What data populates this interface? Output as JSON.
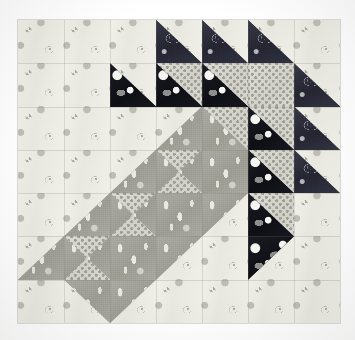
{
  "image": {
    "kind": "quilt-block-photograph",
    "title": "Patchwork quilt block",
    "background_color": "#ffffff",
    "block": {
      "left": 18,
      "top": 20,
      "width": 322,
      "height": 303,
      "rows": 7,
      "columns": 7
    }
  },
  "fabrics": [
    {
      "key": "light",
      "name": "cream floral background",
      "color": "#e9e8e0"
    },
    {
      "key": "dark",
      "name": "navy paisley",
      "color": "#2c2d3a"
    },
    {
      "key": "black",
      "name": "black large-dot print",
      "color": "#15161c"
    },
    {
      "key": "medium",
      "name": "gray teardrop paisley",
      "color": "#a3a29a"
    },
    {
      "key": "dotted",
      "name": "light gray dotted",
      "color": "#d5d4cc"
    }
  ],
  "grid": [
    [
      {
        "type": "plain",
        "a": "light"
      },
      {
        "type": "plain",
        "a": "light"
      },
      {
        "type": "plain",
        "a": "light"
      },
      {
        "type": "hst",
        "dir": "bl",
        "a": "dark",
        "b": "light"
      },
      {
        "type": "hst",
        "dir": "bl",
        "a": "dark",
        "b": "light"
      },
      {
        "type": "hst",
        "dir": "bl",
        "a": "dark",
        "b": "light"
      },
      {
        "type": "plain",
        "a": "light"
      }
    ],
    [
      {
        "type": "plain",
        "a": "light"
      },
      {
        "type": "plain",
        "a": "light"
      },
      {
        "type": "hst",
        "dir": "bl",
        "a": "black",
        "b": "light"
      },
      {
        "type": "hst",
        "dir": "bl",
        "a": "black",
        "b": "dotted"
      },
      {
        "type": "hst",
        "dir": "bl",
        "a": "black",
        "b": "dotted"
      },
      {
        "type": "qsquare",
        "top": "dotted",
        "right": "dotted",
        "bottom": "dotted",
        "left": "dotted"
      },
      {
        "type": "hst",
        "dir": "bl",
        "a": "dark",
        "b": "light"
      }
    ],
    [
      {
        "type": "plain",
        "a": "light"
      },
      {
        "type": "plain",
        "a": "light"
      },
      {
        "type": "plain",
        "a": "light"
      },
      {
        "type": "hst",
        "dir": "br",
        "a": "medium",
        "b": "light"
      },
      {
        "type": "hst",
        "dir": "bl",
        "a": "medium",
        "b": "dotted"
      },
      {
        "type": "hst",
        "dir": "bl",
        "a": "black",
        "b": "dotted"
      },
      {
        "type": "hst",
        "dir": "bl",
        "a": "dark",
        "b": "light"
      }
    ],
    [
      {
        "type": "plain",
        "a": "light"
      },
      {
        "type": "plain",
        "a": "light"
      },
      {
        "type": "hst",
        "dir": "br",
        "a": "medium",
        "b": "light"
      },
      {
        "type": "qsquare",
        "top": "dotted",
        "right": "medium",
        "bottom": "dotted",
        "left": "medium"
      },
      {
        "type": "plain",
        "a": "medium"
      },
      {
        "type": "hst",
        "dir": "bl",
        "a": "black",
        "b": "dotted"
      },
      {
        "type": "hst",
        "dir": "bl",
        "a": "dark",
        "b": "light"
      }
    ],
    [
      {
        "type": "plain",
        "a": "light"
      },
      {
        "type": "hst",
        "dir": "br",
        "a": "medium",
        "b": "light"
      },
      {
        "type": "qsquare",
        "top": "dotted",
        "right": "medium",
        "bottom": "dotted",
        "left": "medium"
      },
      {
        "type": "plain",
        "a": "medium"
      },
      {
        "type": "hst",
        "dir": "tl",
        "a": "medium",
        "b": "light"
      },
      {
        "type": "hst",
        "dir": "bl",
        "a": "black",
        "b": "dotted"
      },
      {
        "type": "plain",
        "a": "light"
      }
    ],
    [
      {
        "type": "hst",
        "dir": "br",
        "a": "medium",
        "b": "light"
      },
      {
        "type": "qsquare",
        "top": "dotted",
        "right": "medium",
        "bottom": "dotted",
        "left": "medium"
      },
      {
        "type": "plain",
        "a": "medium"
      },
      {
        "type": "hst",
        "dir": "tl",
        "a": "medium",
        "b": "light"
      },
      {
        "type": "plain",
        "a": "light"
      },
      {
        "type": "hst",
        "dir": "tl",
        "a": "black",
        "b": "light"
      },
      {
        "type": "plain",
        "a": "light"
      }
    ],
    [
      {
        "type": "plain",
        "a": "light"
      },
      {
        "type": "hst",
        "dir": "tr",
        "a": "medium",
        "b": "light"
      },
      {
        "type": "hst",
        "dir": "tl",
        "a": "medium",
        "b": "light"
      },
      {
        "type": "plain",
        "a": "light"
      },
      {
        "type": "plain",
        "a": "light"
      },
      {
        "type": "plain",
        "a": "light"
      },
      {
        "type": "plain",
        "a": "light"
      }
    ]
  ]
}
